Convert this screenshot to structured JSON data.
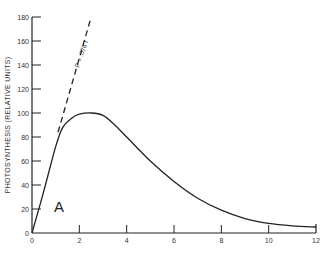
{
  "chart_data": {
    "type": "line",
    "title": "",
    "panel_label": "A",
    "xlabel": "",
    "ylabel": "PHOTOSYNTHESIS (RELATIVE UNITS)",
    "xlim": [
      0,
      12
    ],
    "ylim": [
      0,
      180
    ],
    "x_ticks": [
      "0",
      "2",
      "4",
      "6",
      "8",
      "10",
      "12"
    ],
    "y_ticks": [
      "0",
      "20",
      "40",
      "60",
      "80",
      "100",
      "120",
      "140",
      "160",
      "180"
    ],
    "grid": false,
    "legend": null,
    "series": [
      {
        "name": "Photosynthesis",
        "style": "solid",
        "x": [
          0,
          0.5,
          1.0,
          1.3,
          1.7,
          2.0,
          2.5,
          3.0,
          3.5,
          4.0,
          5.0,
          6.0,
          7.0,
          8.0,
          9.0,
          10.0,
          11.0,
          12.0
        ],
        "y": [
          0,
          35,
          72,
          88,
          96,
          99,
          100,
          98,
          90,
          80,
          60,
          43,
          29,
          19,
          12,
          8,
          6,
          5
        ]
      },
      {
        "name": "P = .076 I",
        "style": "dashed",
        "x": [
          1.1,
          2.5
        ],
        "y": [
          84,
          180
        ]
      }
    ],
    "annotations": [
      {
        "text": "P = .076 I",
        "along": "dashed line"
      },
      {
        "text": "A",
        "position": "lower left"
      }
    ]
  }
}
